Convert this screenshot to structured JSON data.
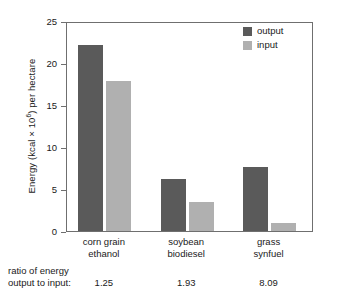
{
  "chart_data": {
    "type": "bar",
    "title": "",
    "xlabel": "",
    "ylabel": "Energy (kcal × 10⁶) per hectare",
    "ylabel_prefix": "Energy (kcal × 10",
    "ylabel_exponent": "6",
    "ylabel_suffix": ") per hectare",
    "ylim": [
      0,
      25
    ],
    "ytick_values": [
      0,
      5,
      10,
      15,
      20,
      25
    ],
    "ytick_labels": [
      "0",
      "5",
      "10",
      "15",
      "20",
      "25"
    ],
    "grid": false,
    "legend_position": "top-right",
    "categories": [
      "corn grain ethanol",
      "soybean biodiesel",
      "grass synfuel"
    ],
    "category_lines": [
      [
        "corn grain",
        "ethanol"
      ],
      [
        "soybean",
        "biodiesel"
      ],
      [
        "grass",
        "synfuel"
      ]
    ],
    "series": [
      {
        "name": "output",
        "color": "#5a5a5a",
        "values": [
          22.1,
          6.2,
          7.6
        ]
      },
      {
        "name": "input",
        "color": "#b0b0b0",
        "values": [
          17.9,
          3.5,
          0.9
        ]
      }
    ],
    "annotations": {
      "ratio_caption_line1": "ratio of energy",
      "ratio_caption_line2": "output to input:",
      "ratio_values": [
        "1.25",
        "1.93",
        "8.09"
      ]
    }
  },
  "legend": {
    "entries": [
      {
        "label": "output",
        "color": "#5a5a5a"
      },
      {
        "label": "input",
        "color": "#b0b0b0"
      }
    ]
  },
  "colors": {
    "output": "#5a5a5a",
    "input": "#b0b0b0",
    "axis": "#6f6f6f",
    "text": "#1a1a1a",
    "background": "#ffffff"
  }
}
